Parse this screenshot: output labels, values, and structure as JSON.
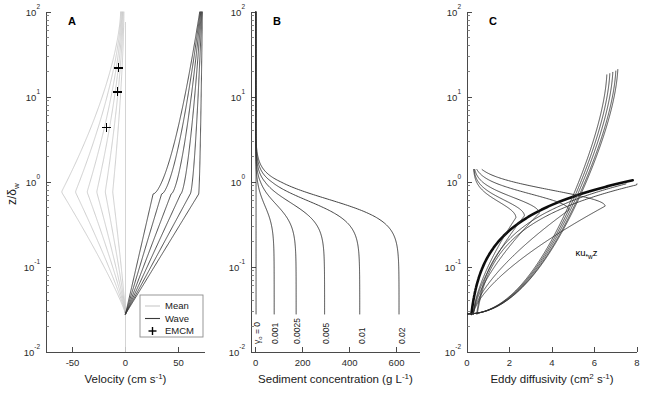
{
  "figure": {
    "width": 645,
    "height": 395,
    "background": "#ffffff",
    "y_axis_label": "z/δ",
    "y_axis_label_sub": "w",
    "y_ticks": [
      "10",
      "10",
      "10",
      "10",
      "10"
    ],
    "y_tick_exponents": [
      "-2",
      "-1",
      "0",
      "1",
      "2"
    ],
    "y_range": [
      0.01,
      100
    ]
  },
  "colors": {
    "wave": "#3a3a3a",
    "mean": "#c8c8c8",
    "sediment": "#303030",
    "eddy": "#2e2e2e",
    "eddy_thick": "#0d0d0d",
    "axis": "#4a4a4a",
    "text": "#1a1a1a"
  },
  "panels": [
    {
      "letter": "A",
      "xlabel": "Velocity (cm s",
      "xlabel_sup": "-1",
      "xlabel_end": ")",
      "x_ticks": [
        -50,
        0,
        50
      ],
      "x_tick_labels": [
        "-50",
        "0",
        "50"
      ],
      "xlim": [
        -75,
        75
      ],
      "legend": {
        "items": [
          {
            "label": "Mean",
            "type": "line",
            "color": "#c8c8c8"
          },
          {
            "label": "Wave",
            "type": "line",
            "color": "#3a3a3a"
          },
          {
            "label": "EMCM",
            "type": "marker",
            "color": "#000000"
          }
        ]
      },
      "emcm_points": [
        {
          "velocity": -6.5,
          "z": 22.0
        },
        {
          "velocity": -7.5,
          "z": 11.5
        },
        {
          "velocity": -18.0,
          "z": 4.4
        }
      ],
      "mean_peak_velocities": [
        -12,
        -19,
        -27,
        -36,
        -47,
        -60
      ],
      "mean_top_velocities": [
        -1.5,
        -2.2,
        -2.8,
        -3.4,
        -4.0,
        -4.6
      ],
      "wave_peak_velocities": [
        26,
        34,
        43,
        52,
        61,
        69
      ],
      "wave_top_velocities": [
        70,
        70.5,
        71,
        71.5,
        72,
        72.5
      ],
      "z0": 0.028
    },
    {
      "letter": "B",
      "xlabel": "Sediment concentration (g L",
      "xlabel_sup": "-1",
      "xlabel_end": ")",
      "x_ticks": [
        0,
        200,
        400,
        600
      ],
      "x_tick_labels": [
        "0",
        "200",
        "400",
        "600"
      ],
      "xlim": [
        -20,
        700
      ],
      "gamma_labels": [
        {
          "text_prefix": "γ",
          "text_sub": "o",
          "text_suffix": " = 0",
          "value": 0,
          "bed_concentration": 2
        },
        {
          "text_prefix": "",
          "text_sub": "",
          "text_suffix": "0.001",
          "value": 0.001,
          "bed_concentration": 80
        },
        {
          "text_prefix": "",
          "text_sub": "",
          "text_suffix": "0.0025",
          "value": 0.0025,
          "bed_concentration": 175
        },
        {
          "text_prefix": "",
          "text_sub": "",
          "text_suffix": "0.005",
          "value": 0.005,
          "bed_concentration": 298
        },
        {
          "text_prefix": "",
          "text_sub": "",
          "text_suffix": "0.01",
          "value": 0.01,
          "bed_concentration": 450
        },
        {
          "text_prefix": "",
          "text_sub": "",
          "text_suffix": "0.02",
          "value": 0.02,
          "bed_concentration": 620
        }
      ],
      "top_concentration": 0.5,
      "z0": 0.028
    },
    {
      "letter": "C",
      "xlabel": "Eddy diffusivity (cm",
      "xlabel_sup": "2",
      "xlabel_mid": " s",
      "xlabel_sup2": "-1",
      "xlabel_end": ")",
      "x_ticks": [
        0,
        2,
        4,
        6,
        8
      ],
      "x_tick_labels": [
        "0",
        "2",
        "4",
        "6",
        "8"
      ],
      "xlim": [
        0,
        8
      ],
      "annotation": {
        "prefix": "κu",
        "sub": "*w",
        "suffix": "z"
      },
      "upper_branch_tops": [
        7.55,
        7.45,
        7.3,
        7.15,
        7.0
      ],
      "upper_branch_top_z": [
        21.0,
        20.2,
        19.5,
        18.8,
        18.2
      ],
      "lower_lobe_peaks": [
        6.5,
        4.8,
        3.4,
        2.7,
        2.3
      ],
      "lower_lobe_peak_z": [
        0.52,
        0.47,
        0.43,
        0.4,
        0.38
      ],
      "wall_layer_slope": 0.0,
      "z0": 0.028
    }
  ]
}
